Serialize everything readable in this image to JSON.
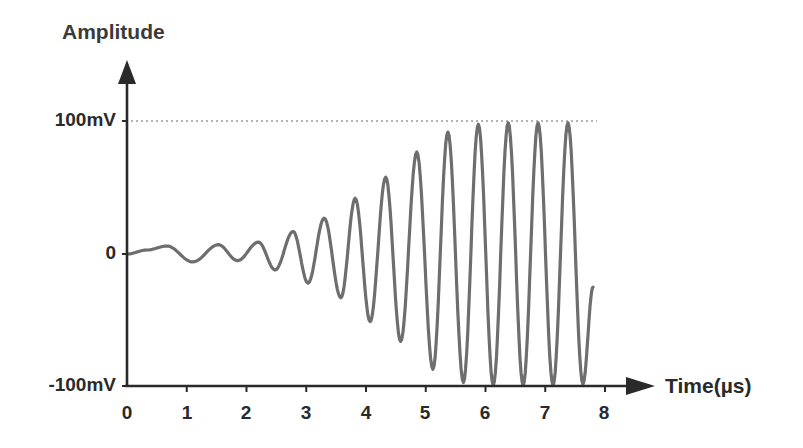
{
  "chart_data": {
    "type": "line",
    "title": "",
    "ylabel": "Amplitude",
    "xlabel": "Time(µs)",
    "x_ticks": [
      "0",
      "1",
      "2",
      "3",
      "4",
      "5",
      "6",
      "7",
      "8"
    ],
    "y_ticks": [
      "-100mV",
      "0",
      "100mV"
    ],
    "xlim": [
      0,
      8
    ],
    "ylim": [
      -100,
      100
    ],
    "grid": false,
    "reference_line": {
      "y": 100,
      "style": "dotted",
      "label": "100mV"
    },
    "series": [
      {
        "name": "Signal",
        "color": "#6e6e6e",
        "description": "Sinusoidal burst with frequency increasing and amplitude growing from ~0 to saturating at ±100mV, cut off at ~7.8µs",
        "x": [
          0,
          0.33,
          0.67,
          1.1,
          1.53,
          1.85,
          2.2,
          2.48,
          2.78,
          3.03,
          3.3,
          3.58,
          3.82,
          4.07,
          4.33,
          4.58,
          4.85,
          5.12,
          5.37,
          5.63,
          5.88,
          6.13,
          6.38,
          6.63,
          6.88,
          7.13,
          7.38,
          7.63,
          7.8
        ],
        "values": [
          0,
          3,
          6,
          -6,
          7,
          -5,
          9,
          -12,
          17,
          -22,
          27,
          -33,
          42,
          -51,
          58,
          -66,
          77,
          -87,
          92,
          -97,
          98,
          -99,
          99,
          -99,
          99,
          -99,
          99,
          -98,
          -25
        ]
      }
    ]
  },
  "labels": {
    "y_axis_title": "Amplitude",
    "x_axis_title": "Time(µs)",
    "y_top": "100mV",
    "y_mid": "0",
    "y_bottom": "-100mV",
    "x_ticks": [
      "0",
      "1",
      "2",
      "3",
      "4",
      "5",
      "6",
      "7",
      "8"
    ]
  },
  "colors": {
    "axis": "#2a2a2a",
    "signal": "#6e6e6e",
    "reference_line": "#9a9a9a"
  }
}
